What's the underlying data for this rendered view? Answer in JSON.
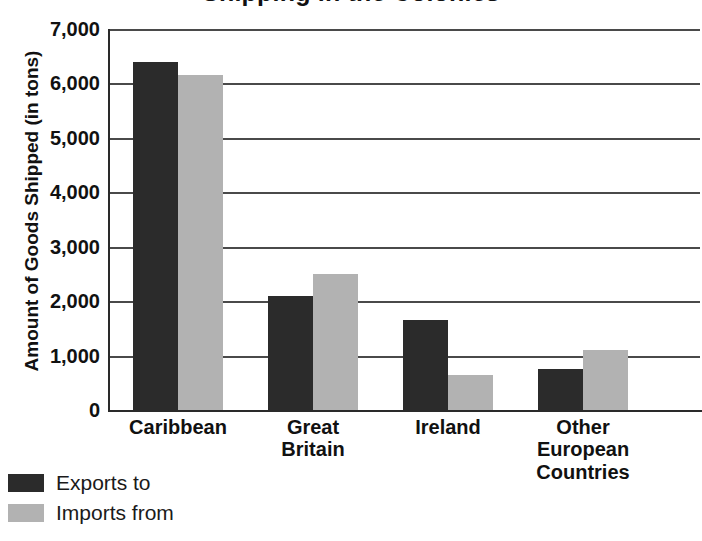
{
  "chart_data": {
    "type": "bar",
    "title": "Shipping in the Colonies",
    "xlabel": "",
    "ylabel": "Amount of Goods Shipped (in tons)",
    "ylim": [
      0,
      7000
    ],
    "ytick_labels": [
      "7,000",
      "6,000",
      "5,000",
      "4,000",
      "3,000",
      "2,000",
      "1,000",
      "0"
    ],
    "ytick_values": [
      7000,
      6000,
      5000,
      4000,
      3000,
      2000,
      1000,
      0
    ],
    "grid": true,
    "legend_position": "bottom-left",
    "categories": [
      "Caribbean",
      "Great Britain",
      "Ireland",
      "Other European Countries"
    ],
    "category_lines": [
      [
        "Caribbean"
      ],
      [
        "Great",
        "Britain"
      ],
      [
        "Ireland"
      ],
      [
        "Other",
        "European",
        "Countries"
      ]
    ],
    "series": [
      {
        "name": "Exports to",
        "color": "#2b2b2b",
        "values": [
          6400,
          2100,
          1650,
          750
        ]
      },
      {
        "name": "Imports from",
        "color": "#b2b2b2",
        "values": [
          6150,
          2500,
          650,
          1100
        ]
      }
    ]
  },
  "legend": {
    "items": [
      {
        "label": "Exports to",
        "swatch": "dark"
      },
      {
        "label": "Imports from",
        "swatch": "light"
      }
    ]
  }
}
